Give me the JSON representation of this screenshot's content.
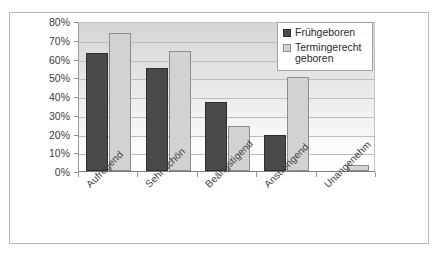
{
  "chart_data": {
    "type": "bar",
    "title": "",
    "subtitle": "",
    "xlabel": "",
    "ylabel": "",
    "categories": [
      "Aufregend",
      "Sehr schön",
      "Beängstigend",
      "Anstrengend",
      "Unangenehm"
    ],
    "series": [
      {
        "name": "Frühgeboren",
        "color": "#4a4a4a",
        "values": [
          63,
          55,
          37,
          19,
          0
        ]
      },
      {
        "name": "Termingerecht geboren",
        "color": "#d2d2d2",
        "values": [
          73.5,
          64,
          24,
          50,
          3
        ]
      }
    ],
    "ylim": [
      0,
      80
    ],
    "ytick_labels": [
      "80%",
      "70%",
      "60%",
      "50%",
      "40%",
      "30%",
      "20%",
      "10%",
      "0%"
    ],
    "ytick_values": [
      80,
      70,
      60,
      50,
      40,
      30,
      20,
      10,
      0
    ],
    "ytick_format": "percent",
    "grid": "horizontal",
    "legend_position": "top-right",
    "legend_entries": [
      {
        "label": "Frühgeboren",
        "swatch": "dark"
      },
      {
        "label": "Termingerecht\ngeboren",
        "swatch": "light"
      }
    ]
  }
}
